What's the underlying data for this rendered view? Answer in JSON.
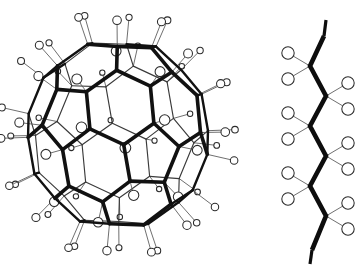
{
  "figure": {
    "title": "",
    "background_color": "#ffffff",
    "ink_color": "#111111",
    "width": 364,
    "height": 272,
    "panels": [
      {
        "name": "hydrogenated-fullerene",
        "label": "",
        "formula": "C60H60"
      },
      {
        "name": "polyethylene-zigzag-chain",
        "label": "",
        "formula": "(CH2)n"
      }
    ]
  },
  "chart_data": {
    "type": "diagram",
    "title": "",
    "subtitle": "",
    "annotations": [],
    "legend": [],
    "structures": [
      {
        "name": "hydrogenated-fullerene",
        "kind": "truncated-icosahedron-cage",
        "center": [
          118,
          134
        ],
        "radius_x": 92,
        "radius_y": 97,
        "carbon_count": 60,
        "hydrogen_count": 60,
        "faces_hexagons": 20,
        "faces_pentagons": 12,
        "hydrogen_circle_radius_front": 5.4,
        "hydrogen_circle_radius_back": 2.6,
        "bond_style": "thick-front-thin-back"
      },
      {
        "name": "polyethylene-zigzag-chain",
        "kind": "zigzag-chain",
        "vertices": [
          [
            324,
            36
          ],
          [
            310,
            66
          ],
          [
            326,
            96
          ],
          [
            310,
            126
          ],
          [
            326,
            156
          ],
          [
            310,
            186
          ],
          [
            326,
            216
          ],
          [
            312,
            250
          ]
        ],
        "hydrogen_offsets": [
          [
            24,
            -12
          ],
          [
            24,
            14
          ],
          [
            -24,
            -12
          ],
          [
            -24,
            14
          ]
        ],
        "hydrogen_circle_radius": 6.2,
        "chain_angle_deg": 112
      }
    ]
  }
}
